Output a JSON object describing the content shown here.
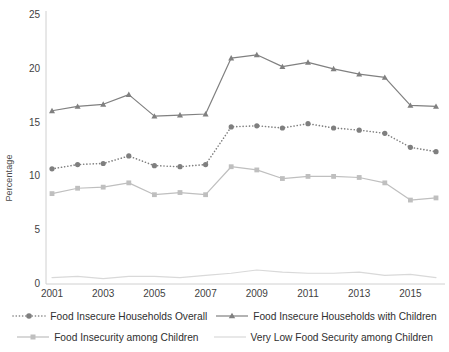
{
  "chart_data": {
    "type": "line",
    "title": "",
    "xlabel": "",
    "ylabel": "Percentage",
    "xlim": [
      2001,
      2016
    ],
    "ylim": [
      0,
      25
    ],
    "yticks": [
      0,
      5,
      10,
      15,
      20,
      25
    ],
    "xticks": [
      2001,
      2003,
      2005,
      2007,
      2009,
      2011,
      2013,
      2015
    ],
    "grid": false,
    "legend_position": "bottom",
    "x": [
      2001,
      2002,
      2003,
      2004,
      2005,
      2006,
      2007,
      2008,
      2009,
      2010,
      2011,
      2012,
      2013,
      2014,
      2015,
      2016
    ],
    "series": [
      {
        "name": "Food Insecure Households Overall",
        "color": "#7f7f7f",
        "line_style": "dotted",
        "marker": "circle",
        "values": [
          10.7,
          11.1,
          11.2,
          11.9,
          11.0,
          10.9,
          11.1,
          14.6,
          14.7,
          14.5,
          14.9,
          14.5,
          14.3,
          14.0,
          12.7,
          12.3
        ]
      },
      {
        "name": "Food Insecure Households with Children",
        "color": "#808080",
        "line_style": "solid",
        "marker": "triangle",
        "values": [
          16.1,
          16.5,
          16.7,
          17.6,
          15.6,
          15.7,
          15.8,
          21.0,
          21.3,
          20.2,
          20.6,
          20.0,
          19.5,
          19.2,
          16.6,
          16.5
        ]
      },
      {
        "name": "Food Insecurity among Children",
        "color": "#bfbfbf",
        "line_style": "solid",
        "marker": "square",
        "values": [
          8.4,
          8.9,
          9.0,
          9.4,
          8.3,
          8.5,
          8.3,
          10.9,
          10.6,
          9.8,
          10.0,
          10.0,
          9.9,
          9.4,
          7.8,
          8.0
        ]
      },
      {
        "name": "Very Low Food Security among Children",
        "color": "#d9d9d9",
        "line_style": "solid",
        "marker": "none",
        "values": [
          0.6,
          0.7,
          0.5,
          0.7,
          0.7,
          0.6,
          0.8,
          1.0,
          1.3,
          1.1,
          1.0,
          1.0,
          1.1,
          0.8,
          0.9,
          0.6
        ]
      }
    ]
  },
  "axis": {
    "y_label": "Percentage",
    "y_ticks": [
      "25",
      "20",
      "15",
      "10",
      "5",
      "0"
    ],
    "x_ticks": [
      "2001",
      "2003",
      "2005",
      "2007",
      "2009",
      "2011",
      "2013",
      "2015"
    ]
  },
  "legend": {
    "row1": [
      "Food Insecure Households Overall",
      "Food Insecure Households with Children"
    ],
    "row2": [
      "Food Insecurity among Children",
      "Very Low Food Security among Children"
    ]
  }
}
